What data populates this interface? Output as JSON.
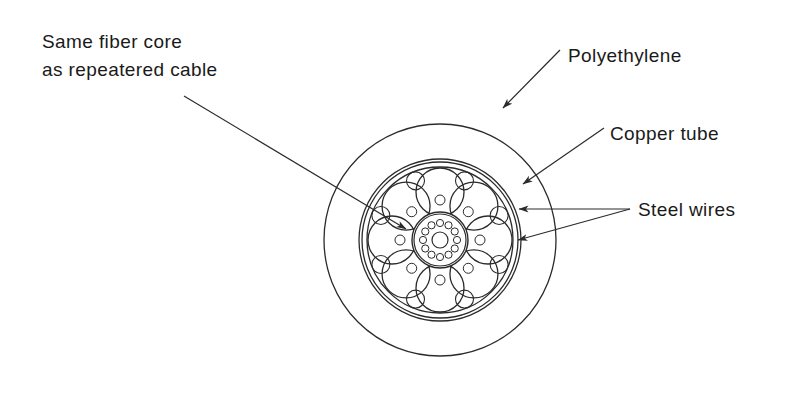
{
  "diagram": {
    "background_color": "#ffffff",
    "line_color": "#2b2b2b",
    "text_color": "#1a1a1a",
    "center": {
      "x": 440,
      "y": 240
    },
    "labels": [
      {
        "id": "fiber-core",
        "lines": [
          "Same fiber core",
          "as repeatered cable"
        ],
        "x": 42,
        "y": 48,
        "line_height": 28,
        "anchor": "start"
      },
      {
        "id": "polyethylene",
        "lines": [
          "Polyethylene"
        ],
        "x": 568,
        "y": 62,
        "line_height": 28,
        "anchor": "start"
      },
      {
        "id": "copper-tube",
        "lines": [
          "Copper tube"
        ],
        "x": 610,
        "y": 140,
        "line_height": 28,
        "anchor": "start"
      },
      {
        "id": "steel-wires",
        "lines": [
          "Steel wires"
        ],
        "x": 638,
        "y": 216,
        "line_height": 28,
        "anchor": "start"
      }
    ],
    "leaders": [
      {
        "id": "leader-fiber-core",
        "x1": 184,
        "y1": 96,
        "x2": 406,
        "y2": 229
      },
      {
        "id": "leader-polyethylene",
        "x1": 560,
        "y1": 50,
        "x2": 503,
        "y2": 108
      },
      {
        "id": "leader-copper-tube",
        "x1": 604,
        "y1": 128,
        "x2": 523,
        "y2": 184
      },
      {
        "id": "leader-steel-wire-filler",
        "x1": 630,
        "y1": 209,
        "x2": 519,
        "y2": 209
      },
      {
        "id": "leader-steel-wire-strand",
        "x1": 630,
        "y1": 209,
        "x2": 518,
        "y2": 240
      }
    ],
    "rings": [
      {
        "id": "polyethylene-jacket-outer",
        "r": 116
      },
      {
        "id": "polyethylene-jacket-inner",
        "r": 81
      },
      {
        "id": "copper-tube-outer",
        "r": 78
      },
      {
        "id": "copper-tube-inner",
        "r": 73
      }
    ],
    "steel_wires": {
      "count": 8,
      "ring_radius": 48,
      "wire_radius": 24,
      "start_angle_deg": -90
    },
    "filler_wires": {
      "count": 8,
      "ring_radius": 64,
      "wire_radius": 9,
      "start_angle_deg": -67.5
    },
    "inner_filler_wires": {
      "count": 8,
      "ring_radius": 40,
      "wire_radius": 5,
      "start_angle_deg": -45
    },
    "core_unit": {
      "id": "fiber-core-unit",
      "outer_radius": 28,
      "wall_radius": 26,
      "fiber_ring": {
        "count": 12,
        "ring_radius": 17,
        "fiber_radius": 3.6,
        "start_angle_deg": -90
      },
      "center_circle_radius": 8
    }
  }
}
